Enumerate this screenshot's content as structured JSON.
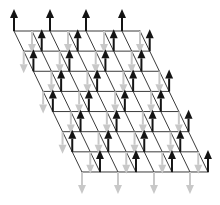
{
  "figure": {
    "name": "antiferromagnetic-spin-lattice",
    "width": 220,
    "height": 205,
    "background_color": "#ffffff"
  },
  "lattice": {
    "rows": 8,
    "cols": 8,
    "cells_rows": 7,
    "cells_cols": 7,
    "origin_x": 14,
    "origin_y": 31,
    "col_step_x": 18.0,
    "col_step_y": 0.0,
    "row_step_x": 9.71,
    "row_step_y": 20.14,
    "line_color": "#3b3b3b",
    "line_width": 1.0,
    "corners": {
      "top_left": [
        14,
        31
      ],
      "top_right": [
        140,
        31
      ],
      "bottom_left": [
        82,
        172
      ],
      "bottom_right": [
        207,
        172
      ]
    }
  },
  "spins": {
    "up": {
      "label": "spin-up",
      "direction": "up",
      "color": "#141414",
      "shaft_length": 22,
      "shaft_width": 2.0,
      "head_length": 9,
      "head_width": 8
    },
    "down": {
      "label": "spin-down",
      "direction": "down",
      "color": "#c8c8c8",
      "shaft_length": 22,
      "shaft_width": 2.0,
      "head_length": 9,
      "head_width": 8
    },
    "pattern": "checkerboard",
    "pattern_rule": "(row + col) even -> spin-up (black), (row + col) odd -> spin-down (light gray)",
    "grid": [
      [
        "up",
        "down",
        "up",
        "down",
        "up",
        "down",
        "up",
        "down"
      ],
      [
        "down",
        "up",
        "down",
        "up",
        "down",
        "up",
        "down",
        "up"
      ],
      [
        "up",
        "down",
        "up",
        "down",
        "up",
        "down",
        "up",
        "down"
      ],
      [
        "down",
        "up",
        "down",
        "up",
        "down",
        "up",
        "down",
        "up"
      ],
      [
        "up",
        "down",
        "up",
        "down",
        "up",
        "down",
        "up",
        "down"
      ],
      [
        "down",
        "up",
        "down",
        "up",
        "down",
        "up",
        "down",
        "up"
      ],
      [
        "up",
        "down",
        "up",
        "down",
        "up",
        "down",
        "up",
        "down"
      ],
      [
        "down",
        "up",
        "down",
        "up",
        "down",
        "up",
        "down",
        "up"
      ]
    ]
  },
  "chart_data": {
    "type": "scatter",
    "title": "",
    "xlabel": "",
    "ylabel": "",
    "legend": [],
    "grid": true,
    "categories": [
      "spin-up",
      "spin-down"
    ],
    "values": [
      32,
      32
    ]
  }
}
